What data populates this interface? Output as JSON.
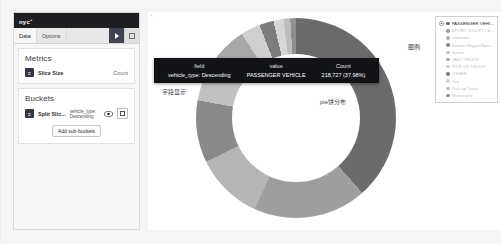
{
  "app": {
    "brand": "nyc",
    "brand_sup": "+"
  },
  "editor": {
    "tabs": [
      {
        "label": "Data",
        "active": true
      },
      {
        "label": "Options",
        "active": false
      }
    ],
    "apply_button_label": "",
    "apply_icon": "play-triangle-icon",
    "collapse_icon": "square-icon",
    "metrics": {
      "title": "Metrics",
      "handle_icon": "drag-handle-icon",
      "agg_label": "Slice Size",
      "agg_value": "Count"
    },
    "buckets": {
      "title": "Buckets",
      "handle_icon": "drag-handle-icon",
      "agg_label": "Split Slic...",
      "agg_sub": "vehicle_type: Descending",
      "eye_icon": "eye-icon",
      "remove_icon": "square-icon",
      "add_sub_buckets_label": "Add sub-buckets"
    }
  },
  "tooltip": {
    "headers": [
      "field",
      "value",
      "Count"
    ],
    "row": {
      "field": "vehicle_type: Descending",
      "value": "PASSENGER VEHICLE",
      "count": "218,727 (37.98%)"
    }
  },
  "annotations": {
    "field_display": "字段显示",
    "pie_distribution": "pie饼分布",
    "legend_callout": "图例"
  },
  "legend": {
    "gear_icon": "gear-icon",
    "items": [
      {
        "label": "PASSENGER VEHICLE",
        "color": "#6b6b6b",
        "highlighted": true
      },
      {
        "label": "SPORT UTILITY / STATION WAGON",
        "color": "#9e9e9e",
        "highlighted": false
      },
      {
        "label": "unknown",
        "color": "#b5b5b5",
        "highlighted": false
      },
      {
        "label": "Station Wagon/Sport Utility Vehicle",
        "color": "#8a8a8a",
        "highlighted": false
      },
      {
        "label": "Sedan",
        "color": "#c2c2c2",
        "highlighted": false
      },
      {
        "label": "VAN / TRUCK",
        "color": "#a8a8a8",
        "highlighted": false
      },
      {
        "label": "PICK-UP TRUCK",
        "color": "#cfcfcf",
        "highlighted": false
      },
      {
        "label": "OTHER",
        "color": "#7d7d7d",
        "highlighted": false
      },
      {
        "label": "Taxi",
        "color": "#d6d6d6",
        "highlighted": false
      },
      {
        "label": "Pick-up Truck",
        "color": "#bcbcbc",
        "highlighted": false
      },
      {
        "label": "Motorcycle",
        "color": "#8f8f8f",
        "highlighted": false
      }
    ]
  },
  "chart_data": {
    "type": "pie",
    "title": "",
    "donut": true,
    "legend_position": "right",
    "total_label": "Count",
    "slices": [
      {
        "label": "PASSENGER VEHICLE",
        "value": 218727,
        "percent": 37.98,
        "color": "#6b6b6b"
      },
      {
        "label": "SPORT UTILITY / STATION WAGON",
        "value": 104000,
        "percent": 18.1,
        "color": "#9e9e9e"
      },
      {
        "label": "unknown",
        "value": 63000,
        "percent": 10.9,
        "color": "#b5b5b5"
      },
      {
        "label": "Station Wagon/Sport Utility Vehicle",
        "value": 57000,
        "percent": 9.9,
        "color": "#8a8a8a"
      },
      {
        "label": "Sedan",
        "value": 42000,
        "percent": 7.3,
        "color": "#c2c2c2"
      },
      {
        "label": "VAN / TRUCK",
        "value": 32000,
        "percent": 5.6,
        "color": "#a8a8a8"
      },
      {
        "label": "PICK-UP TRUCK",
        "value": 18000,
        "percent": 3.1,
        "color": "#cfcfcf"
      },
      {
        "label": "OTHER",
        "value": 13000,
        "percent": 2.3,
        "color": "#7d7d7d"
      },
      {
        "label": "Taxi",
        "value": 9000,
        "percent": 1.6,
        "color": "#d6d6d6"
      },
      {
        "label": "Pick-up Truck",
        "value": 6500,
        "percent": 1.1,
        "color": "#bcbcbc"
      },
      {
        "label": "Motorcycle",
        "value": 5000,
        "percent": 0.9,
        "color": "#8f8f8f"
      }
    ]
  }
}
